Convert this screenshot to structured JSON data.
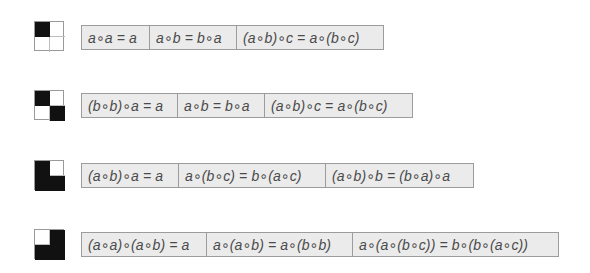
{
  "rows": [
    {
      "icon": {
        "name": "grid-icon-top-left-black",
        "cells": [
          "black",
          "white",
          "white",
          "white"
        ]
      },
      "formulas": [
        {
          "text": "a∘a = a",
          "width": 68
        },
        {
          "text": "a∘b = b∘a",
          "width": 87
        },
        {
          "text": "(a∘b)∘c = a∘(b∘c)",
          "width": 146
        }
      ]
    },
    {
      "icon": {
        "name": "grid-icon-diagonal-black",
        "cells": [
          "black",
          "white",
          "white",
          "black"
        ]
      },
      "formulas": [
        {
          "text": "(b∘b)∘a = a",
          "width": 96
        },
        {
          "text": "a∘b = b∘a",
          "width": 87
        },
        {
          "text": "(a∘b)∘c = a∘(b∘c)",
          "width": 147
        }
      ]
    },
    {
      "icon": {
        "name": "grid-icon-three-black-top-right-white",
        "cells": [
          "black",
          "white",
          "black",
          "black"
        ]
      },
      "formulas": [
        {
          "text": "(a∘b)∘a = a",
          "width": 97
        },
        {
          "text": "a∘(b∘c) = b∘(a∘c)",
          "width": 147
        },
        {
          "text": "(a∘b)∘b = (b∘a)∘a",
          "width": 147
        }
      ]
    },
    {
      "icon": {
        "name": "grid-icon-three-black-top-left-white",
        "cells": [
          "white",
          "black",
          "black",
          "black"
        ]
      },
      "formulas": [
        {
          "text": "(a∘a)∘(a∘b) = a",
          "width": 125
        },
        {
          "text": "a∘(a∘b) = a∘(b∘b)",
          "width": 146
        },
        {
          "text": "a∘(a∘(b∘c)) = b∘(b∘(a∘c))",
          "width": 205
        }
      ]
    }
  ],
  "colors": {
    "box_fill": "#ebebeb",
    "box_border": "#9c9c9c",
    "text": "#4a4a4a",
    "black_cell": "#111111"
  }
}
